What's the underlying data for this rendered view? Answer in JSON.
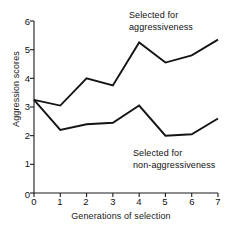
{
  "chart_data": {
    "type": "line",
    "title": "",
    "subtitle": "",
    "xlabel": "Generations of selection",
    "ylabel": "Aggression scores",
    "x": [
      0,
      1,
      2,
      3,
      4,
      5,
      6,
      7
    ],
    "xlim": [
      0,
      7
    ],
    "ylim": [
      0,
      6
    ],
    "xticks": [
      "0",
      "1",
      "2",
      "3",
      "4",
      "5",
      "6",
      "7"
    ],
    "yticks": [
      "0",
      "1",
      "2",
      "3",
      "4",
      "5",
      "6"
    ],
    "grid": false,
    "legend_position": "inline-annotations",
    "series": [
      {
        "name": "Selected for aggressiveness",
        "values": [
          3.25,
          3.05,
          4.0,
          3.75,
          5.25,
          4.55,
          4.8,
          5.35
        ],
        "color": "#141414"
      },
      {
        "name": "Selected for non-aggressiveness",
        "values": [
          3.25,
          2.2,
          2.4,
          2.45,
          3.05,
          2.0,
          2.05,
          2.6
        ],
        "color": "#141414"
      }
    ],
    "annotations": [
      {
        "id": "agg",
        "line1": "Selected for",
        "line2": "aggressiveness"
      },
      {
        "id": "non",
        "line1": "Selected for",
        "line2": "non-aggressiveness"
      }
    ]
  }
}
